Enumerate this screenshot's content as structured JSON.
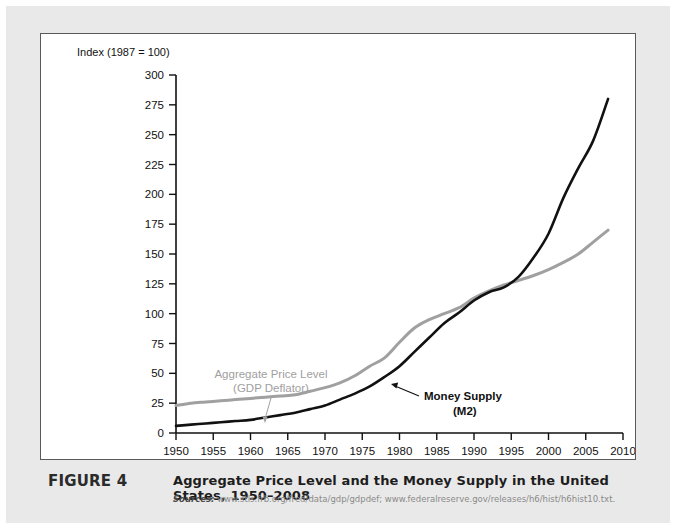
{
  "figure": {
    "number_label": "FIGURE 4",
    "title": "Aggregate Price Level and the Money Supply in the United States, 1950–2008",
    "sources_label": "Sources:",
    "sources_text": "www.stls.frb.org/fred/data/gdp/gdpdef; www.federalreserve.gov/releases/h6/hist/h6hist10.txt."
  },
  "chart_data": {
    "type": "line",
    "title": "",
    "axis_note": "Index (1987 = 100)",
    "xlabel": "",
    "ylabel": "Index (1987 = 100)",
    "xlim": [
      1950,
      2010
    ],
    "ylim": [
      0,
      300
    ],
    "xticks": [
      1950,
      1955,
      1960,
      1965,
      1970,
      1975,
      1980,
      1985,
      1990,
      1995,
      2000,
      2005,
      2010
    ],
    "yticks": [
      0,
      25,
      50,
      75,
      100,
      125,
      150,
      175,
      200,
      225,
      250,
      275,
      300
    ],
    "grid": false,
    "legend": "inline-annotations",
    "annotations": [
      {
        "name": "aggregate-price-level",
        "line1": "Aggregate Price Level",
        "line2": "(GDP Deflator)",
        "color": "#a0a0a0"
      },
      {
        "name": "money-supply",
        "line1": "Money Supply",
        "line2": "(M2)",
        "color": "#111111"
      }
    ],
    "x": [
      1950,
      1952,
      1954,
      1956,
      1958,
      1960,
      1962,
      1964,
      1966,
      1968,
      1970,
      1972,
      1974,
      1976,
      1978,
      1980,
      1982,
      1984,
      1986,
      1988,
      1990,
      1992,
      1994,
      1996,
      1998,
      2000,
      2002,
      2004,
      2006,
      2008
    ],
    "series": [
      {
        "name": "Aggregate Price Level (GDP Deflator)",
        "color": "#a0a0a0",
        "values": [
          23,
          25,
          26,
          27,
          28,
          29,
          30,
          31,
          32,
          35,
          38,
          42,
          48,
          56,
          63,
          76,
          88,
          95,
          100,
          105,
          113,
          119,
          124,
          128,
          132,
          137,
          143,
          150,
          160,
          170
        ]
      },
      {
        "name": "Money Supply (M2)",
        "color": "#111111",
        "values": [
          6,
          7,
          8,
          9,
          10,
          11,
          13,
          15,
          17,
          20,
          23,
          28,
          33,
          39,
          47,
          56,
          68,
          80,
          92,
          101,
          111,
          118,
          122,
          131,
          147,
          167,
          197,
          222,
          245,
          280
        ]
      }
    ]
  }
}
